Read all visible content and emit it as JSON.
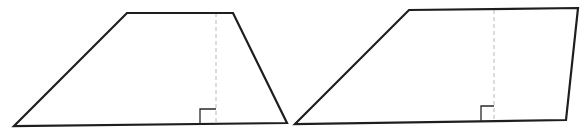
{
  "figure": {
    "colors": {
      "outline": "#1e1e1e",
      "height_line": "#b8b8b8",
      "right_angle": "#2a2a2a",
      "background": "#ffffff"
    },
    "shapes": [
      {
        "name": "trapezoid-left",
        "points": "14,126 127,13 233,13 287,123",
        "height_line": {
          "x1": 216,
          "y1": 13,
          "x2": 216,
          "y2": 124
        },
        "right_angle_marker": "200,124 200,109 216,109"
      },
      {
        "name": "trapezoid-right",
        "points": "295,124 409,10 578,8 566,120",
        "height_line": {
          "x1": 494,
          "y1": 10,
          "x2": 494,
          "y2": 121
        },
        "right_angle_marker": "481,121 481,106 494,106"
      }
    ]
  }
}
